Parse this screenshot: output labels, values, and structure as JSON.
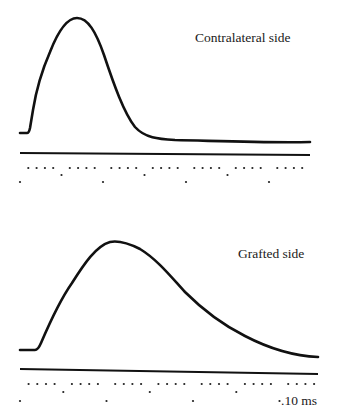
{
  "figure": {
    "panels": [
      {
        "label": "Contralateral side",
        "trace": "M20,133 L27,133 Q29,133 30,128 L33,110 C37,85 43,68 50,52 C57,34 66,18 77,18 C88,18 96,32 104,55 C114,85 124,113 135,127 C145,138 158,139 175,140 C220,141 270,143 310,142",
        "baseline": {
          "x1": 20,
          "y1": 153,
          "x2": 310,
          "y2": 155
        },
        "ticks": {
          "start": 20,
          "spacing": 8.3,
          "count": 35,
          "y_short": 168,
          "y_mid": 175,
          "y_long": 182
        }
      },
      {
        "label": "Grafted side",
        "trace": "M20,350 L35,350 Q38,350 41,343 C50,322 60,300 72,283 C84,264 96,246 110,242 C120,240 130,244 140,249 C158,260 172,278 185,292 C205,312 225,326 245,336 C270,349 295,356 318,357",
        "baseline": {
          "x1": 20,
          "y1": 369,
          "x2": 318,
          "y2": 374
        },
        "ticks": {
          "start": 20,
          "spacing": 8.65,
          "count": 35,
          "y_short": 384,
          "y_mid": 392,
          "y_long": 401
        }
      }
    ],
    "scale_label": ".10 ms"
  }
}
